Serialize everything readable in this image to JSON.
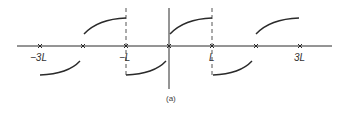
{
  "figure": {
    "caption": "(a)",
    "axis_labels": [
      {
        "text": "−3L",
        "x": 33
      },
      {
        "text": "−L",
        "x": 120
      },
      {
        "text": "L",
        "x": 209
      },
      {
        "text": "3L",
        "x": 293
      }
    ],
    "x_marks": [
      40,
      83,
      126,
      169,
      212,
      256,
      300
    ],
    "colors": {
      "stroke": "#2a2a2a",
      "background": "#ffffff"
    }
  }
}
